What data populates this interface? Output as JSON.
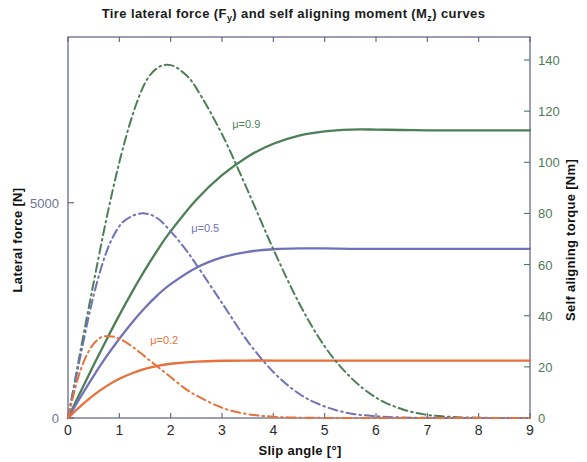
{
  "figure": {
    "title_parts": {
      "pre": "Tire  lateral force (F",
      "sub1": "y",
      "mid": ") and self aligning moment (M",
      "sub2": "z",
      "post": ") curves"
    },
    "title_plain": "Tire lateral force (Fy) and self aligning moment (Mz) curves"
  },
  "colors": {
    "mu_09": "#4d7f57",
    "mu_05": "#6f72b8",
    "mu_02": "#e8703a",
    "axis": "#5b5e7d",
    "right_axis_text": "#4e7a56",
    "left_axis_text": "#6f7296",
    "background": "#ffffff"
  },
  "chart_data": {
    "type": "line",
    "title": "Tire lateral force (Fy) and self aligning moment (Mz) curves",
    "xlabel": "Slip angle [°]",
    "ylabel": "Lateral force [N]",
    "y2label": "Self aligning torque [Nm]",
    "xlim": [
      0,
      9
    ],
    "ylim": [
      0,
      8850
    ],
    "y2lim": [
      0,
      149
    ],
    "grid": false,
    "legend": "inline annotations",
    "xticks": [
      0,
      1,
      2,
      3,
      4,
      5,
      6,
      7,
      8,
      9
    ],
    "xticklabels": [
      "0",
      "1",
      "2",
      "3",
      "4",
      "5",
      "6",
      "7",
      "8",
      "9"
    ],
    "yticks": [
      0,
      5000
    ],
    "yticklabels": [
      "0",
      "5000"
    ],
    "y2ticks": [
      0,
      20,
      40,
      60,
      80,
      100,
      120,
      140
    ],
    "y2ticklabels": [
      "0",
      "20",
      "40",
      "60",
      "80",
      "100",
      "120",
      "140"
    ],
    "annotations": [
      {
        "text": "μ=0.9",
        "x": 3.2,
        "y_px": 128,
        "color": "#4d7f57"
      },
      {
        "text": "μ=0.5",
        "x": 2.4,
        "y_px": 232,
        "color": "#6f72b8"
      },
      {
        "text": "μ=0.2",
        "x": 1.6,
        "y_px": 344,
        "color": "#e8703a"
      }
    ],
    "series": [
      {
        "name": "Lateral force μ=0.9",
        "style": "solid",
        "color": "#4d7f57",
        "axis": "left",
        "x": [
          0,
          0.25,
          0.5,
          0.75,
          1.0,
          1.25,
          1.5,
          1.75,
          2.0,
          2.5,
          3.0,
          3.5,
          4.0,
          4.5,
          5.0,
          5.5,
          6.0,
          6.5,
          7.0,
          7.5,
          8.0,
          8.5,
          9.0
        ],
        "values": [
          0,
          620,
          1230,
          1820,
          2390,
          2930,
          3440,
          3910,
          4340,
          5070,
          5640,
          6070,
          6370,
          6560,
          6660,
          6700,
          6700,
          6690,
          6680,
          6680,
          6680,
          6680,
          6680
        ]
      },
      {
        "name": "Lateral force μ=0.5",
        "style": "solid",
        "color": "#6f72b8",
        "axis": "left",
        "x": [
          0,
          0.25,
          0.5,
          0.75,
          1.0,
          1.25,
          1.5,
          1.75,
          2.0,
          2.5,
          3.0,
          3.5,
          4.0,
          4.5,
          5.0,
          5.5,
          6.0,
          6.5,
          7.0,
          7.5,
          8.0,
          8.5,
          9.0
        ],
        "values": [
          0,
          500,
          980,
          1430,
          1840,
          2220,
          2560,
          2860,
          3110,
          3490,
          3730,
          3860,
          3920,
          3940,
          3940,
          3930,
          3930,
          3930,
          3930,
          3930,
          3930,
          3930,
          3930
        ]
      },
      {
        "name": "Lateral force μ=0.2",
        "style": "solid",
        "color": "#e8703a",
        "axis": "left",
        "x": [
          0,
          0.25,
          0.5,
          0.75,
          1.0,
          1.25,
          1.5,
          1.75,
          2.0,
          2.5,
          3.0,
          3.5,
          4.0,
          4.5,
          5.0,
          5.5,
          6.0,
          6.5,
          7.0,
          7.5,
          8.0,
          8.5,
          9.0
        ],
        "values": [
          0,
          280,
          530,
          740,
          910,
          1040,
          1140,
          1210,
          1260,
          1310,
          1330,
          1335,
          1335,
          1335,
          1335,
          1335,
          1335,
          1335,
          1335,
          1335,
          1335,
          1335,
          1335
        ]
      },
      {
        "name": "Self aligning torque μ=0.9",
        "style": "dash-dot",
        "color": "#4d7f57",
        "axis": "right",
        "x": [
          0,
          0.25,
          0.5,
          0.75,
          1.0,
          1.25,
          1.5,
          1.75,
          2.0,
          2.25,
          2.5,
          3.0,
          3.5,
          4.0,
          4.5,
          5.0,
          5.5,
          6.0,
          6.5,
          7.0,
          7.5,
          8.0,
          8.5,
          9.0
        ],
        "values": [
          0,
          27,
          53,
          78,
          100,
          118,
          131,
          137,
          138,
          135,
          129,
          111,
          89,
          66,
          45,
          28,
          16,
          8,
          3.5,
          1.2,
          0.4,
          0.1,
          0,
          0
        ]
      },
      {
        "name": "Self aligning torque μ=0.5",
        "style": "dash-dot",
        "color": "#6f72b8",
        "axis": "right",
        "x": [
          0,
          0.25,
          0.5,
          0.75,
          1.0,
          1.25,
          1.5,
          1.75,
          2.0,
          2.25,
          2.5,
          3.0,
          3.5,
          4.0,
          4.5,
          5.0,
          5.5,
          6.0,
          6.5,
          7.0,
          7.5,
          8.0,
          8.5,
          9.0
        ],
        "values": [
          0,
          25,
          48,
          65,
          75,
          79,
          80,
          78,
          73,
          67,
          60,
          45,
          30,
          18,
          9.5,
          4.5,
          1.8,
          0.7,
          0.2,
          0.05,
          0,
          0,
          0,
          0
        ]
      },
      {
        "name": "Self aligning torque μ=0.2",
        "style": "dash-dot",
        "color": "#e8703a",
        "axis": "right",
        "x": [
          0,
          0.2,
          0.4,
          0.6,
          0.8,
          1.0,
          1.25,
          1.5,
          1.75,
          2.0,
          2.25,
          2.5,
          3.0,
          3.5,
          4.0,
          4.5,
          5.0,
          5.5,
          6.0,
          7.0,
          8.0,
          9.0
        ],
        "values": [
          0,
          16,
          26,
          31,
          32,
          31,
          28,
          24,
          20,
          16,
          12,
          8.8,
          4.0,
          1.5,
          0.5,
          0.15,
          0.04,
          0,
          0,
          0,
          0,
          0
        ]
      }
    ]
  }
}
